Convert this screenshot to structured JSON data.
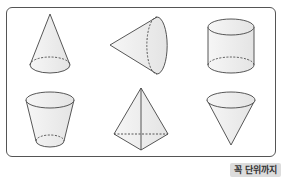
{
  "figure": {
    "shapes": [
      {
        "id": "cone-upright",
        "label": "cone"
      },
      {
        "id": "cone-sideways",
        "label": "cone (sideways)"
      },
      {
        "id": "cylinder",
        "label": "cylinder"
      },
      {
        "id": "truncated-cone",
        "label": "truncated cone"
      },
      {
        "id": "pyramid",
        "label": "triangular pyramid"
      },
      {
        "id": "cone-inverted",
        "label": "inverted cone"
      }
    ]
  },
  "badge": {
    "label": "꼭 단위까지"
  },
  "colors": {
    "stroke": "#444444",
    "fill": "#eeeeee",
    "badge_bg": "#dcdcdc"
  }
}
